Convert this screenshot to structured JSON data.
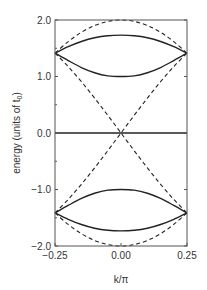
{
  "chart_data": {
    "type": "line",
    "title": "",
    "xlabel": "k/π",
    "ylabel": "energy (units of t_0)",
    "ylabel_main": "energy (units of t",
    "ylabel_sub": "0",
    "ylabel_close": ")",
    "xlim": [
      -0.25,
      0.25
    ],
    "ylim": [
      -2.0,
      2.0
    ],
    "xticks": [
      -0.25,
      0.0,
      0.25
    ],
    "xtick_labels": [
      "-0.25",
      "0.00",
      "0.25"
    ],
    "yticks": [
      -2.0,
      -1.0,
      0.0,
      1.0,
      2.0
    ],
    "ytick_labels": [
      "-2.0",
      "-1.0",
      "0.0",
      "1.0",
      "2.0"
    ],
    "grid": false,
    "legend": null,
    "x": [
      -0.25,
      -0.2,
      -0.15,
      -0.1,
      -0.05,
      0.0,
      0.05,
      0.1,
      0.15,
      0.2,
      0.25
    ],
    "series": [
      {
        "name": "solid-outer-upper",
        "style": "solid",
        "values": [
          1.414,
          1.528,
          1.62,
          1.686,
          1.722,
          1.732,
          1.722,
          1.686,
          1.62,
          1.528,
          1.414
        ]
      },
      {
        "name": "solid-inner-upper",
        "style": "solid",
        "values": [
          1.414,
          1.282,
          1.159,
          1.067,
          1.012,
          1.0,
          1.012,
          1.067,
          1.159,
          1.282,
          1.414
        ]
      },
      {
        "name": "solid-inner-lower",
        "style": "solid",
        "values": [
          -1.414,
          -1.282,
          -1.159,
          -1.067,
          -1.012,
          -1.0,
          -1.012,
          -1.067,
          -1.159,
          -1.282,
          -1.414
        ]
      },
      {
        "name": "solid-outer-lower",
        "style": "solid",
        "values": [
          -1.414,
          -1.528,
          -1.62,
          -1.686,
          -1.722,
          -1.732,
          -1.722,
          -1.686,
          -1.62,
          -1.528,
          -1.414
        ]
      },
      {
        "name": "solid-zero",
        "style": "solid",
        "values": [
          0,
          0,
          0,
          0,
          0,
          0,
          0,
          0,
          0,
          0,
          0
        ]
      },
      {
        "name": "dashed-upper-arc",
        "style": "dashed",
        "values": [
          1.414,
          1.618,
          1.782,
          1.902,
          1.975,
          2.0,
          1.975,
          1.902,
          1.782,
          1.618,
          1.414
        ]
      },
      {
        "name": "dashed-lower-arc",
        "style": "dashed",
        "values": [
          -1.414,
          -1.618,
          -1.782,
          -1.902,
          -1.975,
          -2.0,
          -1.975,
          -1.902,
          -1.782,
          -1.618,
          -1.414
        ]
      },
      {
        "name": "dashed-descending",
        "style": "dashed",
        "values": [
          1.414,
          1.176,
          0.908,
          0.618,
          0.313,
          0.0,
          -0.313,
          -0.618,
          -0.908,
          -1.176,
          -1.414
        ]
      },
      {
        "name": "dashed-ascending",
        "style": "dashed",
        "values": [
          -1.414,
          -1.176,
          -0.908,
          -0.618,
          -0.313,
          0.0,
          0.313,
          0.618,
          0.908,
          1.176,
          1.414
        ]
      }
    ]
  },
  "style": {
    "line_color": "#222222",
    "frame_color": "#555555",
    "text_color": "#333333"
  }
}
